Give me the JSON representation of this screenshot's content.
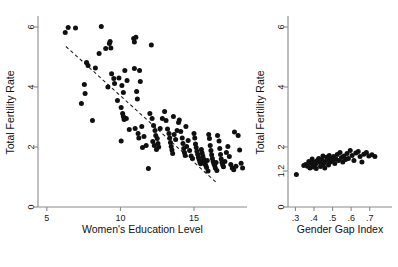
{
  "figure": {
    "background": "#ffffff",
    "point_color": "#101010",
    "axis_color": "#8a8a8a",
    "fit_line_color": "#1a1a1a"
  },
  "chart_data": [
    {
      "type": "scatter",
      "panel": "left",
      "title": "",
      "xlabel": "Women's Education Level",
      "ylabel": "Total Fertility Rate",
      "xlim": [
        4.4,
        18.6
      ],
      "ylim": [
        0,
        6.3
      ],
      "xticks": [
        5,
        10,
        15
      ],
      "xticklabels": [
        "5",
        "10",
        "15"
      ],
      "yticks": [
        0,
        2,
        4,
        6
      ],
      "yticklabels": [
        "0",
        "2",
        "4",
        "6"
      ],
      "grid": false,
      "legend": false,
      "fit_line": {
        "style": "dashed",
        "x_start": 6.3,
        "y_start": 5.35,
        "x_end": 16.6,
        "y_end": 0.78
      },
      "points": [
        [
          6.25,
          5.82
        ],
        [
          6.45,
          5.98
        ],
        [
          6.95,
          5.97
        ],
        [
          8.7,
          6.02
        ],
        [
          7.7,
          4.82
        ],
        [
          7.8,
          4.72
        ],
        [
          8.3,
          4.63
        ],
        [
          8.55,
          5.12
        ],
        [
          9.0,
          5.28
        ],
        [
          9.25,
          5.45
        ],
        [
          9.35,
          5.3
        ],
        [
          9.3,
          5.52
        ],
        [
          10.9,
          5.62
        ],
        [
          11.05,
          5.66
        ],
        [
          10.95,
          5.5
        ],
        [
          12.1,
          5.4
        ],
        [
          7.55,
          4.08
        ],
        [
          7.6,
          3.78
        ],
        [
          7.35,
          3.45
        ],
        [
          8.1,
          2.88
        ],
        [
          9.4,
          4.44
        ],
        [
          9.55,
          4.28
        ],
        [
          9.6,
          4.12
        ],
        [
          9.9,
          4.3
        ],
        [
          10.1,
          4.05
        ],
        [
          10.2,
          3.82
        ],
        [
          10.45,
          4.22
        ],
        [
          10.3,
          4.55
        ],
        [
          10.95,
          4.62
        ],
        [
          11.3,
          4.55
        ],
        [
          11.35,
          4.18
        ],
        [
          11.1,
          3.85
        ],
        [
          9.8,
          3.55
        ],
        [
          10.05,
          3.32
        ],
        [
          10.15,
          3.12
        ],
        [
          10.2,
          3.02
        ],
        [
          10.25,
          2.92
        ],
        [
          10.4,
          2.95
        ],
        [
          10.05,
          2.2
        ],
        [
          10.6,
          2.58
        ],
        [
          11.0,
          2.62
        ],
        [
          11.2,
          2.45
        ],
        [
          11.25,
          2.3
        ],
        [
          11.45,
          2.68
        ],
        [
          11.6,
          2.35
        ],
        [
          11.75,
          2.05
        ],
        [
          11.9,
          1.28
        ],
        [
          11.5,
          1.98
        ],
        [
          12.0,
          3.12
        ],
        [
          12.15,
          2.95
        ],
        [
          12.25,
          2.72
        ],
        [
          12.35,
          2.55
        ],
        [
          12.4,
          2.38
        ],
        [
          12.5,
          2.28
        ],
        [
          12.55,
          2.12
        ],
        [
          12.6,
          2.0
        ],
        [
          12.45,
          1.92
        ],
        [
          12.3,
          2.05
        ],
        [
          12.2,
          2.18
        ],
        [
          12.7,
          2.62
        ],
        [
          12.85,
          2.95
        ],
        [
          13.0,
          3.18
        ],
        [
          13.1,
          2.88
        ],
        [
          13.2,
          2.6
        ],
        [
          13.3,
          2.45
        ],
        [
          13.35,
          2.3
        ],
        [
          13.4,
          2.15
        ],
        [
          13.45,
          2.02
        ],
        [
          13.5,
          1.9
        ],
        [
          13.55,
          1.78
        ],
        [
          13.65,
          2.42
        ],
        [
          13.75,
          2.25
        ],
        [
          13.85,
          2.55
        ],
        [
          13.95,
          2.82
        ],
        [
          14.0,
          2.9
        ],
        [
          14.1,
          2.52
        ],
        [
          14.2,
          2.3
        ],
        [
          14.25,
          2.12
        ],
        [
          14.3,
          1.95
        ],
        [
          14.35,
          1.82
        ],
        [
          14.4,
          1.72
        ],
        [
          14.5,
          2.02
        ],
        [
          14.6,
          2.22
        ],
        [
          14.7,
          1.88
        ],
        [
          14.8,
          1.7
        ],
        [
          14.9,
          1.62
        ],
        [
          15.0,
          2.45
        ],
        [
          15.05,
          2.3
        ],
        [
          15.1,
          2.1
        ],
        [
          15.15,
          1.98
        ],
        [
          15.2,
          1.86
        ],
        [
          15.25,
          1.76
        ],
        [
          15.3,
          1.66
        ],
        [
          15.35,
          1.58
        ],
        [
          15.4,
          1.5
        ],
        [
          15.45,
          1.44
        ],
        [
          15.5,
          1.92
        ],
        [
          15.55,
          1.8
        ],
        [
          15.6,
          1.7
        ],
        [
          15.65,
          1.6
        ],
        [
          15.7,
          1.52
        ],
        [
          15.75,
          1.44
        ],
        [
          15.8,
          1.38
        ],
        [
          15.85,
          1.32
        ],
        [
          15.9,
          1.55
        ],
        [
          16.0,
          2.42
        ],
        [
          16.05,
          2.28
        ],
        [
          16.1,
          2.05
        ],
        [
          16.15,
          1.88
        ],
        [
          16.2,
          1.74
        ],
        [
          16.25,
          1.62
        ],
        [
          16.3,
          1.52
        ],
        [
          16.35,
          1.44
        ],
        [
          16.4,
          1.38
        ],
        [
          16.45,
          1.3
        ],
        [
          16.5,
          1.48
        ],
        [
          16.6,
          2.38
        ],
        [
          16.7,
          2.2
        ],
        [
          16.75,
          1.95
        ],
        [
          16.8,
          1.75
        ],
        [
          16.85,
          1.6
        ],
        [
          16.9,
          1.48
        ],
        [
          16.95,
          1.4
        ],
        [
          17.0,
          1.34
        ],
        [
          17.1,
          1.52
        ],
        [
          17.2,
          1.82
        ],
        [
          17.3,
          2.02
        ],
        [
          17.4,
          1.68
        ],
        [
          17.5,
          1.42
        ],
        [
          17.6,
          1.3
        ],
        [
          17.7,
          1.24
        ],
        [
          17.85,
          1.36
        ],
        [
          18.0,
          2.38
        ],
        [
          18.1,
          1.9
        ],
        [
          18.2,
          1.46
        ],
        [
          18.3,
          1.3
        ],
        [
          9.15,
          4.0
        ],
        [
          11.15,
          3.6
        ],
        [
          13.6,
          3.02
        ],
        [
          14.45,
          2.68
        ],
        [
          15.95,
          1.2
        ],
        [
          16.55,
          1.22
        ],
        [
          17.75,
          2.5
        ]
      ]
    },
    {
      "type": "scatter",
      "panel": "right",
      "title": "",
      "xlabel": "Gender Gap Index",
      "ylabel": "Total Fertility Rate",
      "xlim": [
        0.26,
        0.82
      ],
      "ylim": [
        0,
        6.3
      ],
      "xticks": [
        0.3,
        0.4,
        0.5,
        0.6,
        0.7
      ],
      "xticklabels": [
        ".3",
        ".4",
        ".5",
        ".6",
        ".7"
      ],
      "yticks": [
        0,
        1.2,
        2,
        4,
        6
      ],
      "yticklabels": [
        "0",
        "1.2",
        "2",
        "4",
        "6"
      ],
      "grid": false,
      "legend": false,
      "fit_line": null,
      "points": [
        [
          0.305,
          1.08
        ],
        [
          0.345,
          1.38
        ],
        [
          0.355,
          1.42
        ],
        [
          0.365,
          1.36
        ],
        [
          0.372,
          1.52
        ],
        [
          0.378,
          1.3
        ],
        [
          0.385,
          1.45
        ],
        [
          0.39,
          1.6
        ],
        [
          0.395,
          1.33
        ],
        [
          0.402,
          1.5
        ],
        [
          0.408,
          1.42
        ],
        [
          0.412,
          1.28
        ],
        [
          0.418,
          1.55
        ],
        [
          0.425,
          1.62
        ],
        [
          0.43,
          1.48
        ],
        [
          0.435,
          1.35
        ],
        [
          0.442,
          1.58
        ],
        [
          0.448,
          1.7
        ],
        [
          0.452,
          1.44
        ],
        [
          0.458,
          1.3
        ],
        [
          0.462,
          1.52
        ],
        [
          0.468,
          1.66
        ],
        [
          0.472,
          1.58
        ],
        [
          0.478,
          1.4
        ],
        [
          0.482,
          1.72
        ],
        [
          0.488,
          1.5
        ],
        [
          0.492,
          1.62
        ],
        [
          0.498,
          1.55
        ],
        [
          0.505,
          1.68
        ],
        [
          0.512,
          1.45
        ],
        [
          0.518,
          1.6
        ],
        [
          0.525,
          1.75
        ],
        [
          0.532,
          1.55
        ],
        [
          0.54,
          1.82
        ],
        [
          0.548,
          1.65
        ],
        [
          0.555,
          1.5
        ],
        [
          0.562,
          1.7
        ],
        [
          0.57,
          1.58
        ],
        [
          0.578,
          1.78
        ],
        [
          0.585,
          1.62
        ],
        [
          0.595,
          1.88
        ],
        [
          0.605,
          1.72
        ],
        [
          0.615,
          1.55
        ],
        [
          0.625,
          1.8
        ],
        [
          0.638,
          1.85
        ],
        [
          0.648,
          1.68
        ],
        [
          0.658,
          1.5
        ],
        [
          0.668,
          1.76
        ],
        [
          0.682,
          1.82
        ],
        [
          0.695,
          1.7
        ],
        [
          0.712,
          1.74
        ],
        [
          0.728,
          1.68
        ]
      ]
    }
  ]
}
